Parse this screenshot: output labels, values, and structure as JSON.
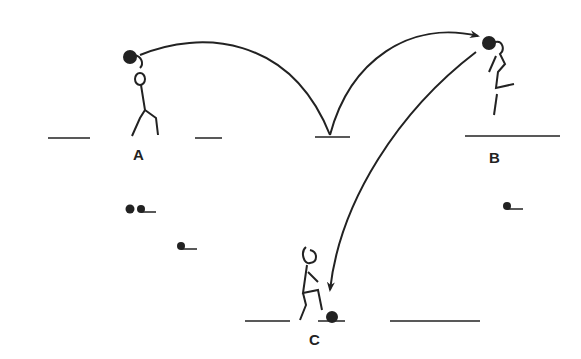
{
  "diagram": {
    "labels": {
      "a": "A",
      "b": "B",
      "c": "C"
    },
    "colors": {
      "ink": "#222222",
      "background": "#ffffff"
    },
    "players": [
      {
        "id": "A",
        "action": "throwing",
        "position": "left"
      },
      {
        "id": "B",
        "action": "jumping-heading",
        "position": "right"
      },
      {
        "id": "C",
        "action": "trapping-ball",
        "position": "bottom-center"
      }
    ],
    "paths": [
      {
        "from": "A",
        "to": "bounce-point",
        "type": "arc"
      },
      {
        "from": "bounce-point",
        "to": "B",
        "type": "arc-arrow"
      },
      {
        "from": "B",
        "to": "C",
        "type": "curve-arrow"
      }
    ],
    "balls": [
      {
        "location": "left-spare-1"
      },
      {
        "location": "left-spare-2"
      },
      {
        "location": "left-spare-3"
      },
      {
        "location": "right-spare"
      },
      {
        "location": "at-C-foot"
      },
      {
        "location": "in-A-hands"
      },
      {
        "location": "at-B-head"
      }
    ]
  }
}
